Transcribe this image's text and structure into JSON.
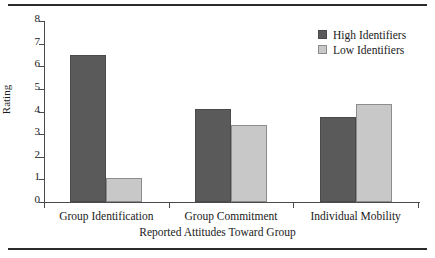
{
  "chart_data": {
    "type": "bar",
    "title": "",
    "subtitle": "",
    "xlabel": "Reported Attitudes Toward Group",
    "ylabel": "Rating",
    "categories": [
      "Group Identification",
      "Group Commitment",
      "Individual Mobility"
    ],
    "series": [
      {
        "name": "High Identifiers",
        "color": "#5a5a5a",
        "values": [
          6.5,
          4.1,
          3.75
        ]
      },
      {
        "name": "Low Identifiers",
        "color": "#c8c8c8",
        "values": [
          1.05,
          3.4,
          4.35
        ]
      }
    ],
    "ylim": [
      0,
      8
    ],
    "ytick_labels": [
      "0",
      "1",
      "2",
      "3",
      "4",
      "5",
      "6",
      "7",
      "8"
    ],
    "ytick_values": [
      0,
      1,
      2,
      3,
      4,
      5,
      6,
      7,
      8
    ],
    "grid": false,
    "legend_position": "top-right"
  }
}
